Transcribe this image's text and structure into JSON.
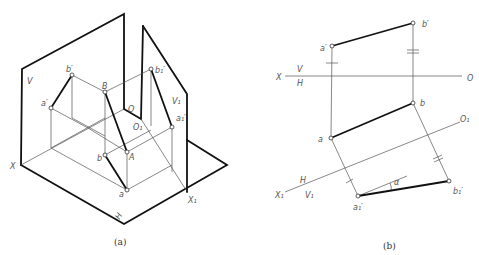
{
  "figure_a": {
    "caption": "(a)",
    "labels": {
      "V": "V",
      "X": "X",
      "H": "H",
      "V1": "V₁",
      "X1": "X₁",
      "O": "O",
      "O1": "O₁",
      "b_prime": "b′",
      "a_prime": "a′",
      "B": "B",
      "A": "A",
      "b": "b",
      "a": "a",
      "b1_prime": "b₁′",
      "a1_prime": "a₁′"
    }
  },
  "figure_b": {
    "caption": "(b)",
    "labels": {
      "X": "X",
      "V": "V",
      "H": "H",
      "O": "O",
      "a_prime": "a′",
      "b_prime": "b′",
      "a": "a",
      "b": "b",
      "O1": "O₁",
      "X1": "X₁",
      "H_lower": "H",
      "V1": "V₁",
      "a1_prime": "a₁′",
      "b1_prime": "b₁′",
      "alpha": "α"
    }
  }
}
